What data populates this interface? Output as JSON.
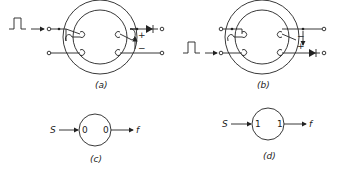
{
  "figure": {
    "panels": [
      {
        "id": "a",
        "label": "(a)",
        "polarity_top": "+",
        "polarity_bottom": "−"
      },
      {
        "id": "b",
        "label": "(b)",
        "polarity_top": "−",
        "polarity_bottom": "+"
      },
      {
        "id": "c",
        "label": "(c)",
        "input": "S",
        "output": "f",
        "left_state": "0",
        "right_state": "0"
      },
      {
        "id": "d",
        "label": "(d)",
        "input": "S",
        "output": "f",
        "left_state": "1",
        "right_state": "1"
      }
    ]
  }
}
